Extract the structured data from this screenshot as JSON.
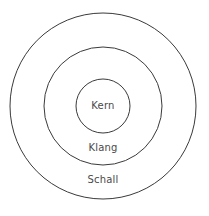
{
  "diagram": {
    "type": "concentric-circles",
    "background_color": "#ffffff",
    "stroke_color": "#3a3a3a",
    "text_color": "#4a4a4a",
    "center": {
      "x": 103,
      "y": 106
    },
    "rings": [
      {
        "id": "outer",
        "label": "Schall",
        "radius": 93,
        "label_x": 103,
        "label_y": 180
      },
      {
        "id": "middle",
        "label": "Klang",
        "radius": 59,
        "label_x": 103,
        "label_y": 148
      },
      {
        "id": "inner",
        "label": "Kern",
        "radius": 27,
        "label_x": 103,
        "label_y": 106
      }
    ]
  }
}
